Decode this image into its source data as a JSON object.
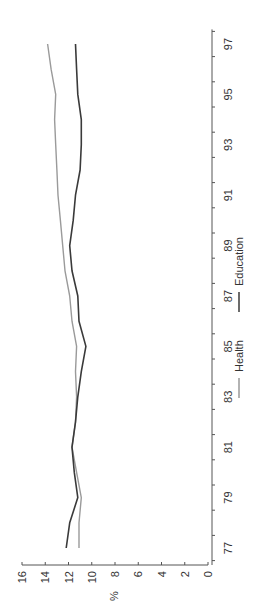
{
  "chart_data": {
    "type": "line",
    "orientation": "rotated-90-ccw",
    "title": "",
    "xlabel": "",
    "ylabel": "%",
    "ylim": [
      0,
      16
    ],
    "yticks": [
      0,
      2,
      4,
      6,
      8,
      10,
      12,
      14,
      16
    ],
    "x": [
      77,
      78,
      79,
      80,
      81,
      82,
      83,
      84,
      85,
      86,
      87,
      88,
      89,
      90,
      91,
      92,
      93,
      94,
      95,
      96,
      97
    ],
    "xtick_labels": [
      "77",
      "79",
      "81",
      "83",
      "85",
      "87",
      "89",
      "91",
      "93",
      "95",
      "97"
    ],
    "grid": false,
    "legend_position": "bottom",
    "series": [
      {
        "name": "Health",
        "color": "#9a9a9a",
        "values": [
          11.1,
          11.1,
          10.9,
          11.3,
          11.7,
          11.4,
          11.3,
          11.4,
          11.3,
          11.7,
          11.9,
          12.3,
          12.5,
          12.7,
          12.9,
          13.0,
          13.1,
          13.2,
          13.1,
          13.5,
          13.8
        ]
      },
      {
        "name": "Education",
        "color": "#3a3a3a",
        "values": [
          12.2,
          11.9,
          11.2,
          11.5,
          11.7,
          11.4,
          11.2,
          10.9,
          10.5,
          11.1,
          11.2,
          11.7,
          11.9,
          11.6,
          11.4,
          11.0,
          10.9,
          10.9,
          11.2,
          11.3,
          11.4
        ]
      }
    ]
  },
  "legend": {
    "items": [
      {
        "label": "Health",
        "color": "#9a9a9a"
      },
      {
        "label": "Education",
        "color": "#3a3a3a"
      }
    ]
  }
}
